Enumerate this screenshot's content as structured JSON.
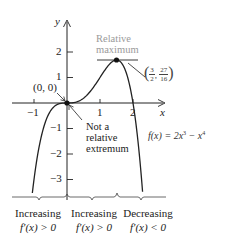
{
  "diagram": {
    "function_label": "f(x) = 2x³ − x⁴",
    "function_label_parts": {
      "prefix": "f(x) = 2x",
      "exp1": "3",
      "mid": " − x",
      "exp2": "4"
    },
    "axes": {
      "x_label": "x",
      "y_label": "y",
      "x_ticks": [
        "−1",
        "1",
        "2"
      ],
      "y_ticks": [
        "2",
        "1",
        "−1",
        "−2",
        "−3"
      ],
      "x_range": [
        -1.6,
        3.0
      ],
      "y_range": [
        -3.8,
        3.2
      ]
    },
    "points": [
      {
        "name": "origin",
        "label": "(0, 0)",
        "x": 0,
        "y": 0
      },
      {
        "name": "relative-maximum",
        "label_num_x": "3",
        "label_den_x": "2",
        "label_num_y": "27",
        "label_den_y": "16",
        "x": 1.5,
        "y": 1.6875
      }
    ],
    "annotations": {
      "relative_max_line1": "Relative",
      "relative_max_line2": "maximum",
      "not_extremum_line1": "Not a",
      "not_extremum_line2": "relative",
      "not_extremum_line3": "extremum"
    },
    "intervals": [
      {
        "label": "Increasing",
        "derivative": "f′(x) > 0"
      },
      {
        "label": "Increasing",
        "derivative": "f′(x) > 0"
      },
      {
        "label": "Decreasing",
        "derivative": "f′(x) < 0"
      }
    ],
    "colors": {
      "curve": "#222222",
      "annotation_gray": "#9a9a9a",
      "axis": "#222222"
    }
  }
}
